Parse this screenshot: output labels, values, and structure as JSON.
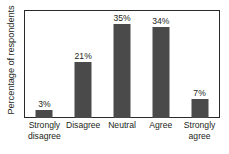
{
  "chart_data": {
    "type": "bar",
    "title": "",
    "subtitle": "",
    "xlabel": "",
    "ylabel": "Percentage of respondents",
    "categories": [
      "Strongly disagree",
      "Disagree",
      "Neutral",
      "Agree",
      "Strongly agree"
    ],
    "category_lines": [
      [
        "Strongly",
        "disagree"
      ],
      [
        "Disagree",
        ""
      ],
      [
        "Neutral",
        ""
      ],
      [
        "Agree",
        ""
      ],
      [
        "Strongly",
        "agree"
      ]
    ],
    "values": [
      3,
      21,
      35,
      34,
      7
    ],
    "data_labels": [
      "3%",
      "21%",
      "35%",
      "34%",
      "7%"
    ],
    "ylim": [
      0,
      40
    ],
    "xlim": null,
    "grid": false,
    "y_ticks_shown": false,
    "x_ticks_shown": false,
    "legend": false,
    "legend_position": "none",
    "bar_color": "#4a4a4a",
    "frame_color": "#2a2a2a",
    "background_color": "#ffffff",
    "text_color": "#231f20"
  }
}
